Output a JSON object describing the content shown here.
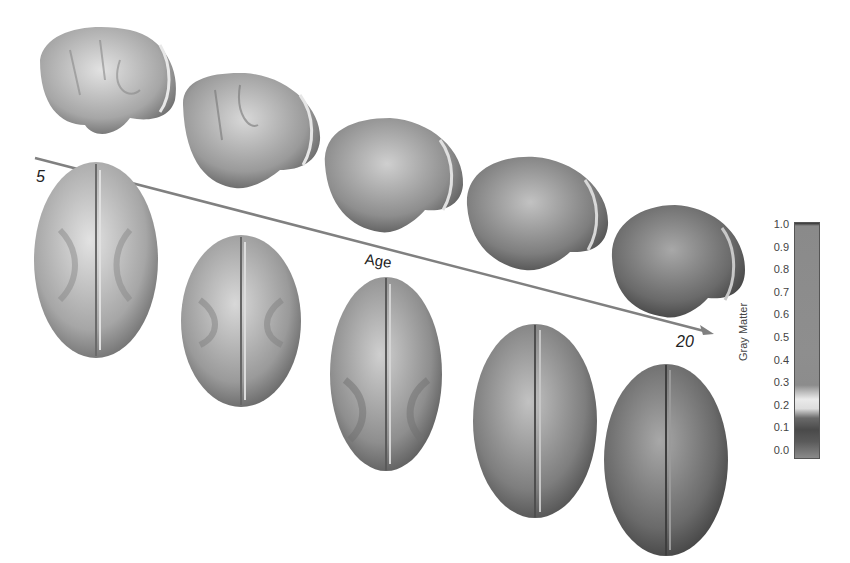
{
  "figure": {
    "arrow": {
      "start_label": "5",
      "end_label": "20",
      "axis_label": "Age",
      "color": "#808080"
    },
    "colorbar": {
      "title": "Gray Matter",
      "ticks": [
        "1.0",
        "0.9",
        "0.8",
        "0.7",
        "0.6",
        "0.5",
        "0.4",
        "0.3",
        "0.2",
        "0.1",
        "0.0"
      ],
      "range": [
        0.0,
        1.0
      ]
    },
    "brains": {
      "lateral": [
        {
          "cx": 95,
          "cy": 75,
          "shade": "#a8a8a8"
        },
        {
          "cx": 240,
          "cy": 120,
          "shade": "#9e9e9e"
        },
        {
          "cx": 390,
          "cy": 165,
          "shade": "#969696"
        },
        {
          "cx": 537,
          "cy": 203,
          "shade": "#8a8a8a"
        },
        {
          "cx": 678,
          "cy": 257,
          "shade": "#707070"
        }
      ],
      "top": [
        {
          "cx": 96,
          "cy": 260,
          "shade": "#a4a4a4"
        },
        {
          "cx": 241,
          "cy": 321,
          "shade": "#9c9c9c"
        },
        {
          "cx": 386,
          "cy": 374,
          "shade": "#8e8e8e"
        },
        {
          "cx": 535,
          "cy": 421,
          "shade": "#808080"
        },
        {
          "cx": 666,
          "cy": 460,
          "shade": "#6a6a6a"
        }
      ]
    }
  }
}
